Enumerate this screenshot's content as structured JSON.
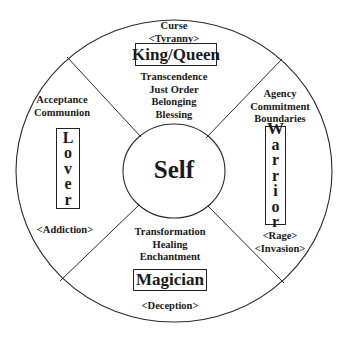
{
  "diagram": {
    "center": {
      "label": "Self"
    },
    "quadrants": {
      "top": {
        "archetype": "King/Queen",
        "shadow": [
          "Curse",
          "<Tyranny>"
        ],
        "qualities": [
          "Transcendence",
          "Just Order",
          "Belonging",
          "Blessing"
        ]
      },
      "right": {
        "archetype": "Warrior",
        "archetype_letters": [
          "W",
          "a",
          "r",
          "r",
          "i",
          "o",
          "r"
        ],
        "qualities": [
          "Agency",
          "Commitment",
          "Boundaries"
        ],
        "shadow": [
          "<Rage>",
          "<Invasion>"
        ]
      },
      "bottom": {
        "archetype": "Magician",
        "qualities": [
          "Transformation",
          "Healing",
          "Enchantment"
        ],
        "shadow": [
          "<Deception>"
        ]
      },
      "left": {
        "archetype": "Lover",
        "archetype_letters": [
          "L",
          "o",
          "v",
          "e",
          "r"
        ],
        "qualities": [
          "Acceptance",
          "Communion"
        ],
        "shadow": [
          "<Addiction>"
        ]
      }
    },
    "colors": {
      "line": "#2a2a2a",
      "background": "#ffffff",
      "text": "#1a1a1a"
    }
  }
}
